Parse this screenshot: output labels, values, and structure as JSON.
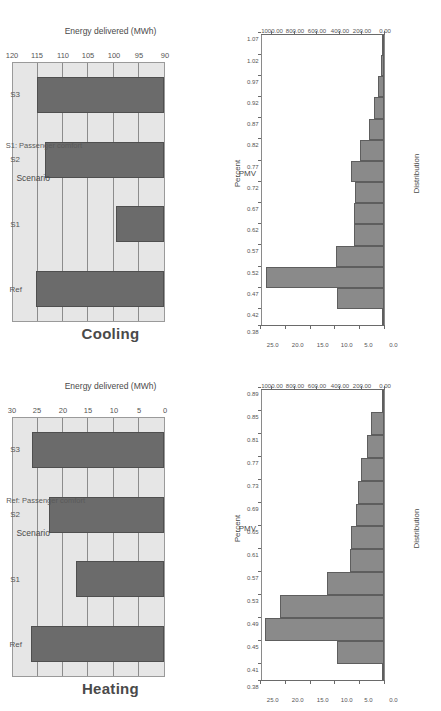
{
  "figure": {
    "layout": "2x2 grid of charts, each rendered upside-down (rotated 180 degrees)",
    "bar_fill": "#6b6b6b",
    "bar_edge": "#4f4f4f",
    "panel_bg": "#e6e6e6",
    "hist_fill": "#8a8a8a",
    "hist_edge": "#5e5e5e"
  },
  "panels": {
    "cooling": {
      "title": "Cooling",
      "xlabel": "Scenario",
      "ylabel": "Energy delivered (MWh)",
      "note": "S1: Passenger comfort"
    },
    "heating": {
      "title": "Heating",
      "xlabel": "Scenario",
      "ylabel": "Energy delivered (MWh)",
      "note": "Ref: Passenger comfort"
    },
    "hist_s1": {
      "xlabel": "PMV",
      "ylabel": "Distribution",
      "toplabel": "Percent"
    },
    "hist_ref": {
      "xlabel": "PMV",
      "ylabel": "Distribution",
      "toplabel": "Percent"
    }
  },
  "chart_data": [
    {
      "id": "cooling",
      "type": "bar",
      "title": "Cooling",
      "xlabel": "Scenario",
      "ylabel": "Energy delivered (MWh)",
      "categories": [
        "Ref",
        "S1",
        "S2",
        "S3"
      ],
      "values": [
        115.5,
        99.5,
        113.6,
        115.3
      ],
      "ylim": [
        90,
        120
      ],
      "yticks": [
        120,
        115,
        110,
        105,
        100,
        95,
        90
      ],
      "ytick_labels": [
        "120",
        "115",
        "110",
        "105",
        "100",
        "95",
        "90"
      ],
      "grid": true,
      "orientation": "vertical",
      "annotation": "S1: Passenger comfort"
    },
    {
      "id": "heating",
      "type": "bar",
      "title": "Heating",
      "xlabel": "Scenario",
      "ylabel": "Energy delivered (MWh)",
      "categories": [
        "Ref",
        "S1",
        "S2",
        "S3"
      ],
      "values": [
        26.5,
        17.5,
        22.8,
        26.2
      ],
      "ylim": [
        0,
        30
      ],
      "yticks": [
        30,
        25,
        20,
        15,
        10,
        5,
        0
      ],
      "ytick_labels": [
        "30",
        "25",
        "20",
        "15",
        "10",
        "5",
        "0"
      ],
      "grid": true,
      "orientation": "vertical",
      "annotation": "Ref: Passenger comfort"
    },
    {
      "id": "hist_s1",
      "type": "bar",
      "subtype": "histogram",
      "title": "S1: Passenger comfort",
      "xlabel": "PMV",
      "ylabel": "Distribution",
      "y2label": "Percent",
      "bin_edges": [
        0.38,
        0.42,
        0.47,
        0.52,
        0.57,
        0.62,
        0.67,
        0.72,
        0.77,
        0.82,
        0.87,
        0.92,
        0.97,
        1.02,
        1.07
      ],
      "bin_edge_labels": [
        "0.38",
        "0.42",
        "0.47",
        "0.52",
        "0.57",
        "0.62",
        "0.67",
        "0.72",
        "0.77",
        "0.82",
        "0.87",
        "0.92",
        "0.97",
        "1.02",
        "1.07"
      ],
      "values": [
        12,
        420,
        1060,
        430,
        270,
        268,
        265,
        300,
        215,
        135,
        90,
        55,
        30,
        12
      ],
      "ylim": [
        0,
        1100
      ],
      "yticks": [
        1000,
        800,
        600,
        400,
        200,
        0
      ],
      "ytick_labels": [
        "1000.00",
        "800.00",
        "600.00",
        "400.00",
        "200.00",
        "0.00"
      ],
      "y2lim": [
        0,
        25
      ],
      "y2ticks": [
        25.0,
        20.0,
        15.0,
        10.0,
        5.0,
        0.0
      ],
      "y2tick_labels": [
        "25.0",
        "20.0",
        "15.0",
        "10.0",
        "5.0",
        "0.0"
      ],
      "grid": false
    },
    {
      "id": "hist_ref",
      "type": "bar",
      "subtype": "histogram",
      "title": "Ref: Passenger comfort",
      "xlabel": "PMV",
      "ylabel": "Distribution",
      "y2label": "Percent",
      "bin_edges": [
        0.38,
        0.41,
        0.45,
        0.49,
        0.53,
        0.57,
        0.61,
        0.65,
        0.69,
        0.73,
        0.77,
        0.81,
        0.85,
        0.89
      ],
      "bin_edge_labels": [
        "0.38",
        "0.41",
        "0.45",
        "0.49",
        "0.53",
        "0.57",
        "0.61",
        "0.65",
        "0.69",
        "0.73",
        "0.77",
        "0.81",
        "0.85",
        "0.89"
      ],
      "values": [
        18,
        420,
        1070,
        940,
        510,
        310,
        300,
        250,
        230,
        205,
        155,
        120,
        20
      ],
      "ylim": [
        0,
        1100
      ],
      "yticks": [
        1000,
        800,
        600,
        400,
        200,
        0
      ],
      "ytick_labels": [
        "1000.00",
        "800.00",
        "600.00",
        "400.00",
        "200.00",
        "0.00"
      ],
      "y2lim": [
        0,
        25
      ],
      "y2ticks": [
        25.0,
        20.0,
        15.0,
        10.0,
        5.0,
        0.0
      ],
      "y2tick_labels": [
        "25.0",
        "20.0",
        "15.0",
        "10.0",
        "5.0",
        "0.0"
      ],
      "grid": false
    }
  ]
}
